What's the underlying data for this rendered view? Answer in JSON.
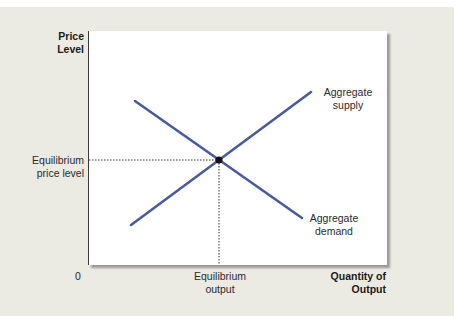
{
  "diagram": {
    "y_axis_label": [
      "Price",
      "Level"
    ],
    "x_axis_label": [
      "Quantity of",
      "Output"
    ],
    "origin_label": "0",
    "equilibrium_price_label": [
      "Equilibrium",
      "price level"
    ],
    "equilibrium_output_label": [
      "Equilibrium",
      "output"
    ],
    "curves": [
      {
        "name": "Aggregate supply",
        "label": [
          "Aggregate",
          "supply"
        ],
        "color": "#4a5a9a"
      },
      {
        "name": "Aggregate demand",
        "label": [
          "Aggregate",
          "demand"
        ],
        "color": "#4a5a9a"
      }
    ],
    "colors": {
      "curve": "#4a5a9a",
      "panel_bg": "#ebeae3",
      "plot_bg": "#ffffff",
      "axis": "#3a3a3a"
    }
  }
}
